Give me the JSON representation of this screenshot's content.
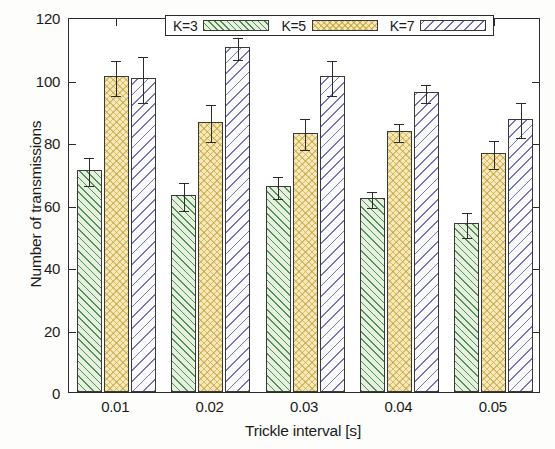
{
  "chart_data": {
    "type": "bar",
    "title": "",
    "xlabel": "Trickle interval [s]",
    "ylabel": "Number of transmissions",
    "categories": [
      "0.01",
      "0.02",
      "0.03",
      "0.04",
      "0.05"
    ],
    "ylim": [
      0,
      120
    ],
    "yticks": [
      0,
      20,
      40,
      60,
      80,
      100,
      120
    ],
    "ytick_labels": [
      "0",
      "20",
      "40",
      "60",
      "80",
      "100",
      "120"
    ],
    "grid": false,
    "legend_position": "top-center-inside",
    "series": [
      {
        "name": "K=3",
        "color": "#e6f0e0",
        "hatch": "diagonal-green",
        "values": [
          71,
          63,
          66,
          62,
          54
        ],
        "errors": [
          4.5,
          4.5,
          3.5,
          2.5,
          4.0
        ]
      },
      {
        "name": "K=5",
        "color": "#f6e9b9",
        "hatch": "crosshatch-yellow",
        "values": [
          101,
          86.5,
          83,
          83.5,
          76.5
        ],
        "errors": [
          5.5,
          6.0,
          5.0,
          3.0,
          4.5
        ]
      },
      {
        "name": "K=7",
        "color": "#fbfbfe",
        "hatch": "diagonal-blue",
        "values": [
          100.5,
          110.5,
          101,
          96,
          87.5
        ],
        "errors": [
          7.5,
          3.5,
          5.5,
          3.0,
          5.5
        ]
      }
    ]
  },
  "axes": {
    "ylabel": "Number of transmissions",
    "xlabel": "Trickle interval [s]"
  },
  "legend": {
    "entries": [
      {
        "label": "K=3"
      },
      {
        "label": "K=5"
      },
      {
        "label": "K=7"
      }
    ]
  }
}
